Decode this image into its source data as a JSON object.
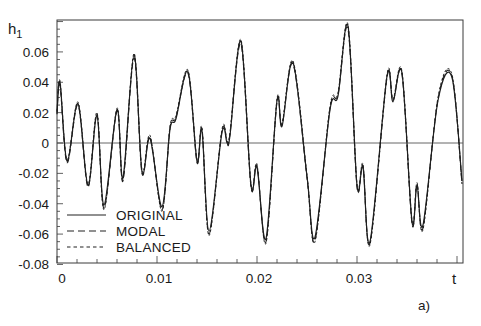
{
  "figure": {
    "panel_label": "a)"
  },
  "chart_data": {
    "type": "line",
    "title": "",
    "xlabel": "t",
    "ylabel": "h1",
    "ylabel_main": "h",
    "ylabel_sub": "1",
    "xlim": [
      0,
      0.04
    ],
    "ylim": [
      -0.08,
      0.08
    ],
    "grid": false,
    "zero_line": true,
    "legend_position": "lower left",
    "x_ticks": [
      0,
      0.01,
      0.02,
      0.03
    ],
    "x_tick_labels": [
      "0",
      "0.01",
      "0.02",
      "0.03"
    ],
    "y_ticks": [
      0.06,
      0.04,
      0.02,
      0,
      -0.02,
      -0.04,
      -0.06,
      -0.08
    ],
    "y_tick_labels": [
      "0.06",
      "0.04",
      "0.02",
      "0",
      "-0.02",
      "-0.04",
      "-0.06",
      "-0.08"
    ],
    "x": [
      0.0,
      0.0003,
      0.001,
      0.0021,
      0.0031,
      0.004,
      0.0047,
      0.006,
      0.0066,
      0.0077,
      0.0085,
      0.0093,
      0.0105,
      0.0113,
      0.0119,
      0.0131,
      0.014,
      0.0145,
      0.0152,
      0.0165,
      0.017,
      0.0173,
      0.0184,
      0.0194,
      0.02,
      0.0209,
      0.022,
      0.0225,
      0.0236,
      0.025,
      0.0258,
      0.0273,
      0.0281,
      0.0291,
      0.03,
      0.0306,
      0.0313,
      0.033,
      0.0336,
      0.0345,
      0.0355,
      0.036,
      0.0366,
      0.0381,
      0.0395,
      0.0405
    ],
    "series": [
      {
        "name": "ORIGINAL",
        "style": "solid",
        "values": [
          0.019,
          0.04,
          -0.012,
          0.026,
          -0.028,
          0.018,
          -0.041,
          0.022,
          -0.023,
          0.058,
          -0.019,
          0.003,
          -0.042,
          0.009,
          0.016,
          0.047,
          -0.012,
          0.008,
          -0.058,
          0.007,
          0.0,
          0.005,
          0.067,
          -0.028,
          -0.016,
          -0.063,
          0.028,
          0.011,
          0.053,
          -0.022,
          -0.062,
          0.022,
          0.031,
          0.077,
          -0.028,
          -0.016,
          -0.065,
          0.044,
          0.027,
          0.046,
          -0.052,
          -0.028,
          -0.054,
          0.028,
          0.043,
          -0.025
        ]
      },
      {
        "name": "MODAL",
        "style": "dashed",
        "values": [
          0.02,
          0.038,
          -0.013,
          0.025,
          -0.029,
          0.019,
          -0.043,
          0.021,
          -0.025,
          0.056,
          -0.02,
          0.004,
          -0.044,
          0.01,
          0.017,
          0.046,
          -0.013,
          0.009,
          -0.06,
          0.008,
          0.001,
          0.006,
          0.065,
          -0.029,
          -0.015,
          -0.065,
          0.027,
          0.012,
          0.052,
          -0.023,
          -0.064,
          0.023,
          0.032,
          0.075,
          -0.029,
          -0.015,
          -0.066,
          0.043,
          0.028,
          0.045,
          -0.053,
          -0.027,
          -0.056,
          0.029,
          0.044,
          -0.027
        ]
      },
      {
        "name": "BALANCED",
        "style": "short-dashed",
        "values": [
          0.021,
          0.041,
          -0.011,
          0.027,
          -0.027,
          0.02,
          -0.044,
          0.023,
          -0.024,
          0.059,
          -0.018,
          0.005,
          -0.045,
          0.011,
          0.018,
          0.048,
          -0.011,
          0.01,
          -0.061,
          0.009,
          0.002,
          0.007,
          0.068,
          -0.027,
          -0.014,
          -0.066,
          0.029,
          0.013,
          0.054,
          -0.021,
          -0.065,
          0.024,
          0.033,
          0.078,
          -0.027,
          -0.014,
          -0.067,
          0.045,
          0.029,
          0.047,
          -0.051,
          -0.026,
          -0.057,
          0.03,
          0.045,
          -0.026
        ]
      }
    ]
  },
  "legend": {
    "items": [
      {
        "label": "ORIGINAL",
        "dash": ""
      },
      {
        "label": "MODAL",
        "dash": "7,4"
      },
      {
        "label": "BALANCED",
        "dash": "3.5,3"
      }
    ]
  }
}
